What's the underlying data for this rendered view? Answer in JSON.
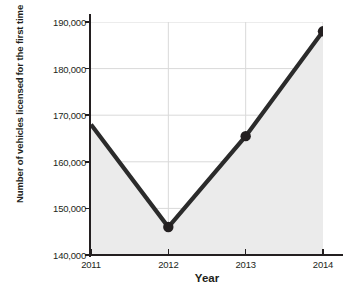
{
  "chart_data": {
    "type": "line",
    "title": "",
    "xlabel": "Year",
    "ylabel_lines": [
      "Number of vehicles licensed",
      "for the first time"
    ],
    "ylabel": "Number of vehicles licensed for the first time",
    "categories": [
      "2011",
      "2012",
      "2013",
      "2014"
    ],
    "x": [
      2011,
      2012,
      2013,
      2014
    ],
    "values": [
      168000,
      146000,
      165500,
      188000
    ],
    "ylim": [
      140000,
      190000
    ],
    "yticks": [
      140000,
      150000,
      160000,
      170000,
      180000,
      190000
    ],
    "ytick_labels": [
      "140,000",
      "150,000",
      "160,000",
      "170,000",
      "180,000",
      "190,000"
    ],
    "xtick_labels": [
      "2011",
      "2012",
      "2013",
      "2014"
    ],
    "grid": true,
    "grid_axis": "y",
    "legend": false,
    "legend_position": "none",
    "markers": [
      false,
      true,
      true,
      true
    ],
    "area_fill": true,
    "colors": {
      "line": "#2b2b2b",
      "marker": "#231f20",
      "area_fill": "#ebebeb",
      "grid": "#d9d9d9",
      "axis": "#231f20",
      "text": "#231f20",
      "background": "#ffffff"
    },
    "annotations": []
  }
}
